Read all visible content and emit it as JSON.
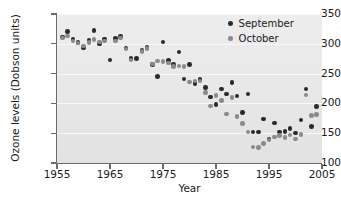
{
  "chart_data": {
    "type": "scatter",
    "title": "",
    "xlabel": "Year",
    "ylabel": "Ozone levels (Dobson units)",
    "xlim": [
      1955,
      2005
    ],
    "ylim": [
      100,
      350
    ],
    "xticks": [
      1955,
      1965,
      1975,
      1985,
      1995,
      2005
    ],
    "xticklabels": [
      "1955",
      "1965",
      "1975",
      "1985",
      "1995",
      "2005"
    ],
    "yticks": [
      100,
      150,
      200,
      250,
      300,
      350
    ],
    "yticklabels": [
      "100",
      "150",
      "200",
      "250",
      "300",
      "350"
    ],
    "grid": "horizontal-white",
    "legend_position": "top-right",
    "series": [
      {
        "name": "September",
        "color": "#2b2b2b",
        "points": [
          [
            1956,
            311
          ],
          [
            1957,
            321
          ],
          [
            1958,
            308
          ],
          [
            1959,
            302
          ],
          [
            1960,
            293
          ],
          [
            1961,
            306
          ],
          [
            1962,
            322
          ],
          [
            1963,
            300
          ],
          [
            1964,
            308
          ],
          [
            1965,
            273
          ],
          [
            1966,
            309
          ],
          [
            1967,
            312
          ],
          [
            1968,
            293
          ],
          [
            1969,
            275
          ],
          [
            1970,
            275
          ],
          [
            1971,
            289
          ],
          [
            1972,
            295
          ],
          [
            1973,
            265
          ],
          [
            1974,
            245
          ],
          [
            1975,
            303
          ],
          [
            1976,
            272
          ],
          [
            1977,
            265
          ],
          [
            1978,
            286
          ],
          [
            1979,
            241
          ],
          [
            1980,
            265
          ],
          [
            1981,
            233
          ],
          [
            1982,
            240
          ],
          [
            1983,
            227
          ],
          [
            1984,
            211
          ],
          [
            1985,
            198
          ],
          [
            1986,
            224
          ],
          [
            1987,
            216
          ],
          [
            1988,
            235
          ],
          [
            1989,
            212
          ],
          [
            1990,
            185
          ],
          [
            1991,
            216
          ],
          [
            1992,
            152
          ],
          [
            1993,
            152
          ],
          [
            1994,
            174
          ],
          [
            1995,
            140
          ],
          [
            1996,
            167
          ],
          [
            1997,
            152
          ],
          [
            1998,
            153
          ],
          [
            1999,
            158
          ],
          [
            2000,
            150
          ],
          [
            2001,
            172
          ],
          [
            2002,
            224
          ],
          [
            2003,
            161
          ],
          [
            2004,
            195
          ]
        ]
      },
      {
        "name": "October",
        "color": "#8a8a8a",
        "points": [
          [
            1956,
            310
          ],
          [
            1957,
            313
          ],
          [
            1958,
            305
          ],
          [
            1959,
            301
          ],
          [
            1960,
            296
          ],
          [
            1961,
            302
          ],
          [
            1962,
            307
          ],
          [
            1963,
            303
          ],
          [
            1964,
            305
          ],
          [
            1966,
            305
          ],
          [
            1967,
            310
          ],
          [
            1968,
            291
          ],
          [
            1969,
            273
          ],
          [
            1971,
            287
          ],
          [
            1972,
            292
          ],
          [
            1973,
            266
          ],
          [
            1974,
            271
          ],
          [
            1975,
            270
          ],
          [
            1976,
            268
          ],
          [
            1977,
            262
          ],
          [
            1978,
            263
          ],
          [
            1979,
            262
          ],
          [
            1980,
            236
          ],
          [
            1981,
            238
          ],
          [
            1982,
            238
          ],
          [
            1983,
            218
          ],
          [
            1984,
            196
          ],
          [
            1985,
            213
          ],
          [
            1986,
            205
          ],
          [
            1987,
            182
          ],
          [
            1988,
            210
          ],
          [
            1989,
            178
          ],
          [
            1990,
            166
          ],
          [
            1991,
            152
          ],
          [
            1992,
            127
          ],
          [
            1993,
            126
          ],
          [
            1994,
            133
          ],
          [
            1995,
            139
          ],
          [
            1996,
            144
          ],
          [
            1997,
            146
          ],
          [
            1998,
            143
          ],
          [
            1999,
            147
          ],
          [
            2000,
            140
          ],
          [
            2001,
            148
          ],
          [
            2002,
            214
          ],
          [
            2003,
            180
          ],
          [
            2004,
            181
          ]
        ]
      }
    ]
  },
  "legend": {
    "items": [
      {
        "label": "September",
        "color": "#2b2b2b"
      },
      {
        "label": "October",
        "color": "#8a8a8a"
      }
    ]
  }
}
